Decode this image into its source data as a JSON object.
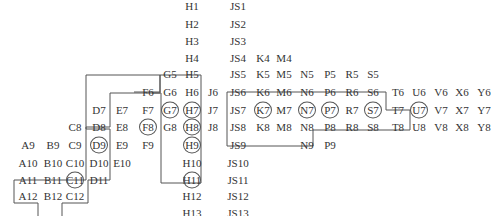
{
  "diagram": {
    "type": "grid-lattice",
    "col_x": {
      "A": 28,
      "B": 53,
      "C": 75,
      "D": 99,
      "E": 122,
      "F": 148,
      "G": 170,
      "H": 192,
      "J": 213,
      "JS": 238,
      "K": 263,
      "M": 284,
      "N": 307,
      "P": 330,
      "R": 352,
      "S": 373,
      "T": 397,
      "U": 418,
      "V": 441,
      "X": 462,
      "Y": 484,
      "Z": 503
    },
    "row_y": {
      "1": 8,
      "2": 27,
      "3": 45,
      "4": 64,
      "5": 83,
      "6": 102,
      "7": 121,
      "8": 139,
      "9": 158,
      "10": 177,
      "11": 195,
      "12": 214,
      "13": 233
    },
    "cells": [
      {
        "label": "H1",
        "col": "H",
        "row": "1"
      },
      {
        "label": "JS1",
        "col": "JS",
        "row": "1"
      },
      {
        "label": "H2",
        "col": "H",
        "row": "2"
      },
      {
        "label": "JS2",
        "col": "JS",
        "row": "2"
      },
      {
        "label": "H3",
        "col": "H",
        "row": "3"
      },
      {
        "label": "JS3",
        "col": "JS",
        "row": "3"
      },
      {
        "label": "H4",
        "col": "H",
        "row": "4"
      },
      {
        "label": "JS4",
        "col": "JS",
        "row": "4"
      },
      {
        "label": "K4",
        "col": "K",
        "row": "4"
      },
      {
        "label": "M4",
        "col": "M",
        "row": "4"
      },
      {
        "label": "G5",
        "col": "G",
        "row": "5"
      },
      {
        "label": "H5",
        "col": "H",
        "row": "5"
      },
      {
        "label": "JS5",
        "col": "JS",
        "row": "5"
      },
      {
        "label": "K5",
        "col": "K",
        "row": "5"
      },
      {
        "label": "M5",
        "col": "M",
        "row": "5"
      },
      {
        "label": "N5",
        "col": "N",
        "row": "5"
      },
      {
        "label": "P5",
        "col": "P",
        "row": "5"
      },
      {
        "label": "R5",
        "col": "R",
        "row": "5"
      },
      {
        "label": "S5",
        "col": "S",
        "row": "5"
      },
      {
        "label": "F6",
        "col": "F",
        "row": "6"
      },
      {
        "label": "G6",
        "col": "G",
        "row": "6"
      },
      {
        "label": "H6",
        "col": "H",
        "row": "6"
      },
      {
        "label": "J6",
        "col": "J",
        "row": "6"
      },
      {
        "label": "JS6",
        "col": "JS",
        "row": "6"
      },
      {
        "label": "K6",
        "col": "K",
        "row": "6"
      },
      {
        "label": "M6",
        "col": "M",
        "row": "6"
      },
      {
        "label": "N6",
        "col": "N",
        "row": "6"
      },
      {
        "label": "P6",
        "col": "P",
        "row": "6"
      },
      {
        "label": "R6",
        "col": "R",
        "row": "6"
      },
      {
        "label": "S6",
        "col": "S",
        "row": "6"
      },
      {
        "label": "T6",
        "col": "T",
        "row": "6"
      },
      {
        "label": "U6",
        "col": "U",
        "row": "6"
      },
      {
        "label": "V6",
        "col": "V",
        "row": "6"
      },
      {
        "label": "X6",
        "col": "X",
        "row": "6"
      },
      {
        "label": "Y6",
        "col": "Y",
        "row": "6"
      },
      {
        "label": "Z6",
        "col": "Z",
        "row": "6"
      },
      {
        "label": "D7",
        "col": "D",
        "row": "7"
      },
      {
        "label": "E7",
        "col": "E",
        "row": "7"
      },
      {
        "label": "F7",
        "col": "F",
        "row": "7"
      },
      {
        "label": "G7",
        "col": "G",
        "row": "7",
        "circled": true
      },
      {
        "label": "H7",
        "col": "H",
        "row": "7",
        "circled": true
      },
      {
        "label": "J7",
        "col": "J",
        "row": "7"
      },
      {
        "label": "JS7",
        "col": "JS",
        "row": "7"
      },
      {
        "label": "K7",
        "col": "K",
        "row": "7",
        "circled": true
      },
      {
        "label": "M7",
        "col": "M",
        "row": "7"
      },
      {
        "label": "N7",
        "col": "N",
        "row": "7",
        "circled": true
      },
      {
        "label": "P7",
        "col": "P",
        "row": "7",
        "circled": true
      },
      {
        "label": "R7",
        "col": "R",
        "row": "7"
      },
      {
        "label": "S7",
        "col": "S",
        "row": "7",
        "circled": true
      },
      {
        "label": "T7",
        "col": "T",
        "row": "7"
      },
      {
        "label": "U7",
        "col": "U",
        "row": "7",
        "circled": true
      },
      {
        "label": "V7",
        "col": "V",
        "row": "7"
      },
      {
        "label": "X7",
        "col": "X",
        "row": "7"
      },
      {
        "label": "Y7",
        "col": "Y",
        "row": "7"
      },
      {
        "label": "Z7",
        "col": "Z",
        "row": "7"
      },
      {
        "label": "C8",
        "col": "C",
        "row": "8"
      },
      {
        "label": "D8",
        "col": "D",
        "row": "8"
      },
      {
        "label": "E8",
        "col": "E",
        "row": "8"
      },
      {
        "label": "F8",
        "col": "F",
        "row": "8",
        "circled": true
      },
      {
        "label": "G8",
        "col": "G",
        "row": "8"
      },
      {
        "label": "H8",
        "col": "H",
        "row": "8",
        "circled": true
      },
      {
        "label": "J8",
        "col": "J",
        "row": "8"
      },
      {
        "label": "JS8",
        "col": "JS",
        "row": "8"
      },
      {
        "label": "K8",
        "col": "K",
        "row": "8"
      },
      {
        "label": "M8",
        "col": "M",
        "row": "8"
      },
      {
        "label": "N8",
        "col": "N",
        "row": "8"
      },
      {
        "label": "P8",
        "col": "P",
        "row": "8"
      },
      {
        "label": "R8",
        "col": "R",
        "row": "8"
      },
      {
        "label": "S8",
        "col": "S",
        "row": "8"
      },
      {
        "label": "T8",
        "col": "T",
        "row": "8"
      },
      {
        "label": "U8",
        "col": "U",
        "row": "8"
      },
      {
        "label": "V8",
        "col": "V",
        "row": "8"
      },
      {
        "label": "X8",
        "col": "X",
        "row": "8"
      },
      {
        "label": "Y8",
        "col": "Y",
        "row": "8"
      },
      {
        "label": "Z8",
        "col": "Z",
        "row": "8"
      },
      {
        "label": "A9",
        "col": "A",
        "row": "9"
      },
      {
        "label": "B9",
        "col": "B",
        "row": "9"
      },
      {
        "label": "C9",
        "col": "C",
        "row": "9"
      },
      {
        "label": "D9",
        "col": "D",
        "row": "9",
        "circled": true
      },
      {
        "label": "E9",
        "col": "E",
        "row": "9"
      },
      {
        "label": "F9",
        "col": "F",
        "row": "9"
      },
      {
        "label": "H9",
        "col": "H",
        "row": "9",
        "circled": true
      },
      {
        "label": "JS9",
        "col": "JS",
        "row": "9"
      },
      {
        "label": "N9",
        "col": "N",
        "row": "9"
      },
      {
        "label": "P9",
        "col": "P",
        "row": "9"
      },
      {
        "label": "A10",
        "col": "A",
        "row": "10"
      },
      {
        "label": "B10",
        "col": "B",
        "row": "10"
      },
      {
        "label": "C10",
        "col": "C",
        "row": "10"
      },
      {
        "label": "D10",
        "col": "D",
        "row": "10"
      },
      {
        "label": "E10",
        "col": "E",
        "row": "10"
      },
      {
        "label": "H10",
        "col": "H",
        "row": "10"
      },
      {
        "label": "JS10",
        "col": "JS",
        "row": "10"
      },
      {
        "label": "A11",
        "col": "A",
        "row": "11"
      },
      {
        "label": "B11",
        "col": "B",
        "row": "11"
      },
      {
        "label": "C11",
        "col": "C",
        "row": "11",
        "circled": true
      },
      {
        "label": "D11",
        "col": "D",
        "row": "11"
      },
      {
        "label": "H11",
        "col": "H",
        "row": "11",
        "circled": true
      },
      {
        "label": "JS11",
        "col": "JS",
        "row": "11"
      },
      {
        "label": "A12",
        "col": "A",
        "row": "12"
      },
      {
        "label": "B12",
        "col": "B",
        "row": "12"
      },
      {
        "label": "C12",
        "col": "C",
        "row": "12"
      },
      {
        "label": "H12",
        "col": "H",
        "row": "12"
      },
      {
        "label": "JS12",
        "col": "JS",
        "row": "12"
      },
      {
        "label": "H13",
        "col": "H",
        "row": "13"
      },
      {
        "label": "JS13",
        "col": "JS",
        "row": "13"
      }
    ],
    "outlines": [
      {
        "name": "left-staircase-outline",
        "points": "133,96 133,75 201,75 201,227 162,227 162,132 230,132"
      },
      {
        "name": "left-staircase-outline-lower",
        "points": "80,168 80,134 114,134 114,93 130,93"
      },
      {
        "name": "right-band-outline",
        "points": "226,75 226,145 253,145 "
      }
    ],
    "line_color": "#555555",
    "text_color": "#333333"
  }
}
